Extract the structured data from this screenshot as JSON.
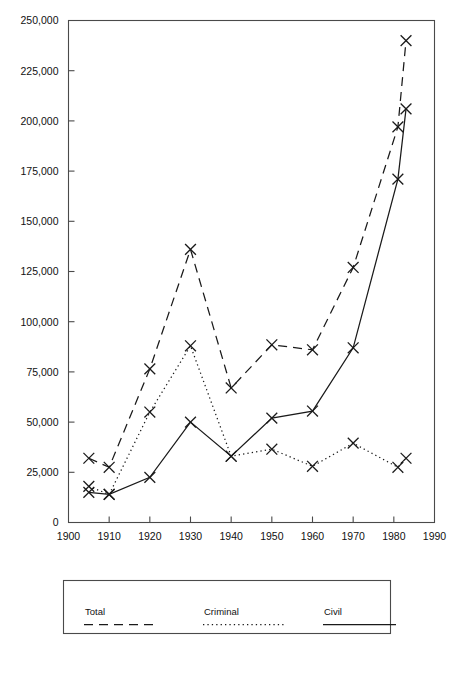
{
  "chart_data": {
    "type": "line",
    "title": "",
    "subtitle": "",
    "xlabel": "",
    "ylabel": "",
    "xlim": [
      1900,
      1990
    ],
    "ylim": [
      0,
      250000
    ],
    "x_ticks": [
      1900,
      1910,
      1920,
      1930,
      1940,
      1950,
      1960,
      1970,
      1980,
      1990
    ],
    "x_tick_labels": [
      "1900",
      "1910",
      "1920",
      "1930",
      "1940",
      "1950",
      "1960",
      "1970",
      "1980",
      "1990"
    ],
    "y_ticks": [
      0,
      25000,
      50000,
      75000,
      100000,
      125000,
      150000,
      175000,
      200000,
      225000,
      250000
    ],
    "y_tick_labels": [
      "0",
      "25,000",
      "50,000",
      "75,000",
      "100,000",
      "125,000",
      "150,000",
      "175,000",
      "200,000",
      "225,000",
      "250,000"
    ],
    "grid": false,
    "legend_position": "bottom",
    "marker": "x",
    "series": [
      {
        "name": "Total",
        "style": "dashed",
        "x": [
          1905,
          1910,
          1920,
          1930,
          1940,
          1950,
          1960,
          1970,
          1981,
          1983
        ],
        "values": [
          32000,
          27500,
          76500,
          136000,
          67000,
          88500,
          86000,
          127000,
          197000,
          240000
        ]
      },
      {
        "name": "Criminal",
        "style": "dotted",
        "x": [
          1905,
          1910,
          1920,
          1930,
          1940,
          1950,
          1960,
          1970,
          1981,
          1983
        ],
        "values": [
          18000,
          14000,
          55000,
          88000,
          33000,
          36500,
          28000,
          39500,
          27500,
          32000
        ]
      },
      {
        "name": "Civil",
        "style": "solid",
        "x": [
          1905,
          1910,
          1920,
          1930,
          1940,
          1950,
          1960,
          1970,
          1981,
          1983
        ],
        "values": [
          15000,
          14000,
          22500,
          50000,
          33000,
          52000,
          55500,
          87000,
          171000,
          206000
        ]
      }
    ]
  },
  "legend": {
    "entries": [
      {
        "label": "Total",
        "style": "dashed"
      },
      {
        "label": "Criminal",
        "style": "dotted"
      },
      {
        "label": "Civil",
        "style": "solid"
      }
    ]
  }
}
